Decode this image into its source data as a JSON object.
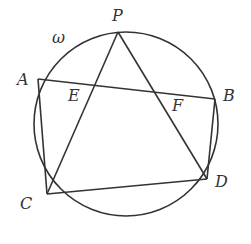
{
  "diagram": {
    "type": "geometry",
    "circle": {
      "label": "ω",
      "cx": 126,
      "cy": 124,
      "r": 92
    },
    "points": {
      "P": {
        "label": "P",
        "x": 118,
        "y": 32
      },
      "A": {
        "label": "A",
        "x": 38,
        "y": 79
      },
      "B": {
        "label": "B",
        "x": 215,
        "y": 99
      },
      "C": {
        "label": "C",
        "x": 47,
        "y": 194
      },
      "D": {
        "label": "D",
        "x": 207,
        "y": 179
      },
      "E": {
        "label": "E",
        "x": 95,
        "y": 85
      },
      "F": {
        "label": "F",
        "x": 158,
        "y": 92
      }
    },
    "segments": [
      [
        "A",
        "B"
      ],
      [
        "A",
        "C"
      ],
      [
        "B",
        "D"
      ],
      [
        "C",
        "D"
      ],
      [
        "P",
        "C"
      ],
      [
        "P",
        "D"
      ]
    ],
    "colors": {
      "stroke": "#333333",
      "background": "#ffffff"
    }
  }
}
